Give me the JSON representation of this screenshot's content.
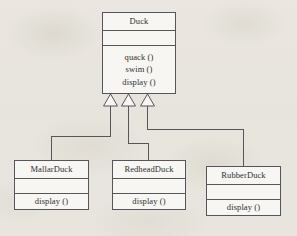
{
  "diagram": {
    "type": "uml-class-diagram",
    "relationship": "generalization",
    "background_color": "#f4f2ee",
    "stroke_color": "#55555a",
    "text_color": "#2e2e31"
  },
  "classes": {
    "superclass": {
      "name": "Duck",
      "attributes": [],
      "operations": [
        "quack ()",
        "swim ()",
        "display ()"
      ]
    },
    "subclasses": [
      {
        "name": "MallarDuck",
        "attributes": [],
        "operations": [
          "display ()"
        ]
      },
      {
        "name": "RedheadDuck",
        "attributes": [],
        "operations": [
          "display ()"
        ]
      },
      {
        "name": "RubberDuck",
        "attributes": [],
        "operations": [
          "display ()"
        ]
      }
    ]
  }
}
